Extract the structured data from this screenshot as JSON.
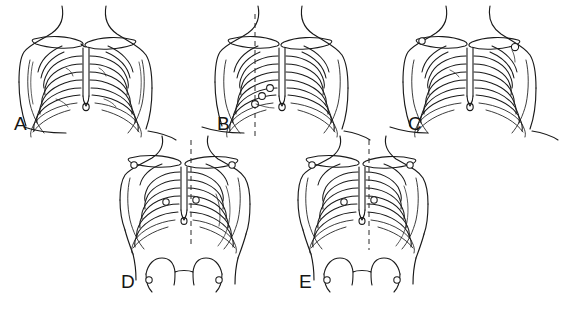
{
  "figure": {
    "background_color": "#ffffff",
    "ink_color": "#1a1a1a",
    "width": 573,
    "height": 311,
    "panel_count": 5,
    "row_counts": [
      3,
      2
    ]
  },
  "panels": [
    {
      "id": "A",
      "label": "A",
      "label_x": 14,
      "label_y": 130,
      "row": 1,
      "column": 1,
      "view": "anterior-chest",
      "origin_x": 0,
      "origin_y": 0,
      "has_pelvis": false,
      "has_dashed_line": false,
      "markers": 0,
      "rib_pairs": 10
    },
    {
      "id": "B",
      "label": "B",
      "label_x": 217,
      "label_y": 130,
      "row": 1,
      "column": 2,
      "view": "anterior-chest",
      "origin_x": 196,
      "origin_y": 0,
      "has_pelvis": false,
      "has_dashed_line": true,
      "markers": 3,
      "rib_pairs": 10
    },
    {
      "id": "C",
      "label": "C",
      "label_x": 408,
      "label_y": 130,
      "row": 1,
      "column": 3,
      "view": "anterior-chest",
      "origin_x": 384,
      "origin_y": 0,
      "has_pelvis": false,
      "has_dashed_line": false,
      "markers": 2,
      "rib_pairs": 10
    },
    {
      "id": "D",
      "label": "D",
      "label_x": 128,
      "label_y": 288,
      "row": 2,
      "column": 1,
      "view": "chest-and-pelvis",
      "origin_x": 104,
      "origin_y": 134,
      "has_pelvis": true,
      "has_dashed_line": true,
      "markers": 6,
      "rib_pairs": 10
    },
    {
      "id": "E",
      "label": "E",
      "label_x": 303,
      "label_y": 288,
      "row": 2,
      "column": 2,
      "view": "chest-and-pelvis",
      "origin_x": 282,
      "origin_y": 134,
      "has_pelvis": true,
      "has_dashed_line": true,
      "markers": 6,
      "rib_pairs": 10
    }
  ],
  "legend": {
    "line_style_solid": "bone and body outline",
    "line_style_dashed": "reference vertical line",
    "marker_shape": "small open circle landmark"
  }
}
